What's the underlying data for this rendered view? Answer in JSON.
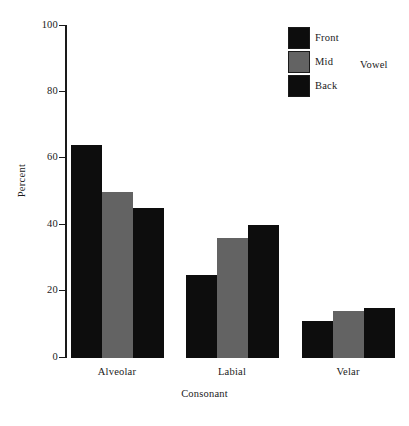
{
  "chart_data": {
    "type": "bar",
    "title": "",
    "xlabel": "Consonant",
    "ylabel": "Percent",
    "categories": [
      "Alveolar",
      "Labial",
      "Velar"
    ],
    "series": [
      {
        "name": "Front",
        "values": [
          64,
          25,
          11
        ],
        "color": "#0d0d0d"
      },
      {
        "name": "Mid",
        "values": [
          50,
          36,
          14
        ],
        "color": "#636363"
      },
      {
        "name": "Back",
        "values": [
          45,
          40,
          15
        ],
        "color": "#0d0d0d"
      }
    ],
    "ylim": [
      0,
      100
    ],
    "yticks": [
      0,
      20,
      40,
      60,
      80,
      100
    ],
    "ytick_labels": [
      "0",
      "20",
      "40",
      "60",
      "80",
      "100"
    ],
    "grid": false,
    "legend": {
      "title": "Vowel",
      "position": "top-right"
    }
  },
  "axes": {
    "y_title": "Percent",
    "x_title": "Consonant",
    "y_labels": [
      "100",
      "80",
      "60",
      "40",
      "20",
      "0"
    ]
  },
  "legend": {
    "title": "Vowel",
    "entries": [
      {
        "label": "Front",
        "color": "#0d0d0d"
      },
      {
        "label": "Mid",
        "color": "#636363"
      },
      {
        "label": "Back",
        "color": "#0d0d0d"
      }
    ]
  },
  "groups": [
    {
      "label": "Alveolar"
    },
    {
      "label": "Labial"
    },
    {
      "label": "Velar"
    }
  ],
  "colors": {
    "dark": "#0d0d0d",
    "gray": "#636363",
    "axis": "#1a1a1a",
    "background": "#ffffff"
  }
}
